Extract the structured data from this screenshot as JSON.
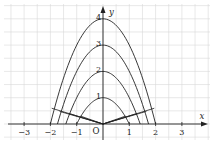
{
  "diagram": {
    "type": "coordinate-plot",
    "axes": {
      "x_label": "x",
      "y_label": "y",
      "origin_label": "O",
      "x_ticks": [
        {
          "value": -3,
          "label": "−3"
        },
        {
          "value": -2,
          "label": "−2"
        },
        {
          "value": -1,
          "label": "−1"
        },
        {
          "value": 1,
          "label": "1"
        },
        {
          "value": 2,
          "label": "2"
        },
        {
          "value": 3,
          "label": "3"
        }
      ],
      "x_range": [
        -3.9,
        4.2
      ],
      "y_range": [
        -0.5,
        4.8
      ]
    },
    "grid": {
      "spacing": 0.5,
      "color": "#d8d8d8"
    },
    "curves": [
      {
        "equation": "y = 4 - x^2",
        "vertex_label": "4",
        "k": 4
      },
      {
        "equation": "y = 3 - x^2",
        "vertex_label": "3",
        "k": 3
      },
      {
        "equation": "y = 2 - x^2",
        "vertex_label": "2",
        "k": 2
      },
      {
        "equation": "y = 1 - x^2",
        "vertex_label": "1",
        "k": 1
      }
    ],
    "segments_from_origin": [
      {
        "to": [
          1.95,
          0.6
        ]
      },
      {
        "to": [
          1.65,
          0.48
        ]
      },
      {
        "to": [
          1.3,
          0.4
        ]
      },
      {
        "to": [
          0.85,
          0.3
        ]
      }
    ],
    "line_color": "#222222"
  }
}
